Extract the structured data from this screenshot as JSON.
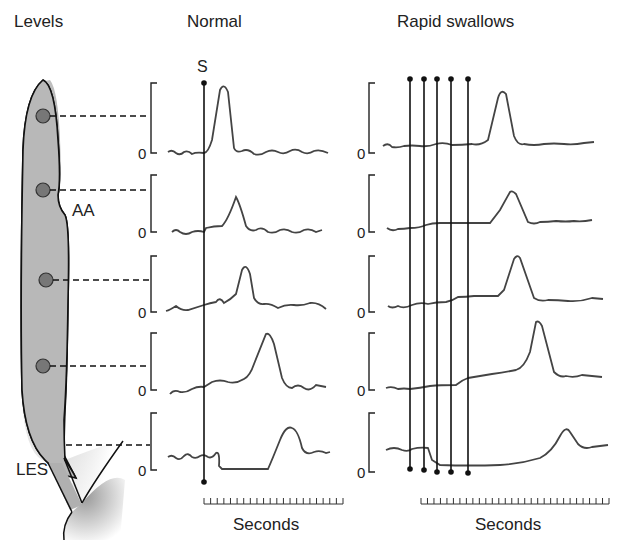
{
  "titles": {
    "levels": "Levels",
    "normal": "Normal",
    "rapid": "Rapid swallows"
  },
  "esophagus": {
    "labels": {
      "aortic_arch": "AA",
      "les": "LES"
    },
    "sensor_count": 4,
    "fill_color": "#b8b8b8"
  },
  "normal_panel": {
    "swallow_marker": "S",
    "zero_label": "0",
    "x_axis_label": "Seconds",
    "tick_count": 22
  },
  "rapid_panel": {
    "swallow_markers": 5,
    "zero_label": "0",
    "x_axis_label": "Seconds",
    "tick_count": 30
  },
  "chart_data": [
    {
      "type": "line",
      "title": "Normal",
      "xlabel": "Seconds",
      "ylabel": "Pressure",
      "description": "Single swallow (S): peristaltic pressure wave propagates distally, peaks progressively later at each level; LES relaxes after swallow then contracts",
      "series": [
        {
          "name": "Level 1 (upper)",
          "peak_time_rel": 0.15,
          "baseline": 0
        },
        {
          "name": "Level 2 (AA)",
          "peak_time_rel": 0.25,
          "baseline": 0
        },
        {
          "name": "Level 3",
          "peak_time_rel": 0.35,
          "baseline": 0
        },
        {
          "name": "Level 4",
          "peak_time_rel": 0.5,
          "baseline": 0
        },
        {
          "name": "LES",
          "relaxation": true,
          "peak_time_rel": 0.7
        }
      ]
    },
    {
      "type": "line",
      "title": "Rapid swallows",
      "xlabel": "Seconds",
      "ylabel": "Pressure",
      "description": "Five rapid swallows: deglutitive inhibition suppresses body contractions until the last swallow; LES stays relaxed, single peristaltic wave follows the final swallow",
      "series": [
        {
          "name": "Level 1 (upper)",
          "peak_time_rel": 0.45
        },
        {
          "name": "Level 2 (AA)",
          "peak_time_rel": 0.55
        },
        {
          "name": "Level 3",
          "peak_time_rel": 0.62
        },
        {
          "name": "Level 4",
          "peak_time_rel": 0.7
        },
        {
          "name": "LES",
          "relaxation": true,
          "peak_time_rel": 0.82
        }
      ]
    }
  ]
}
